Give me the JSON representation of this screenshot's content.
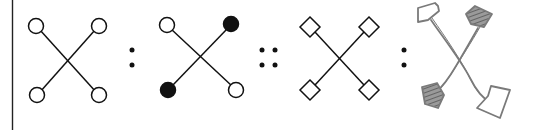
{
  "puzzle": {
    "type": "visual-analogy",
    "relation": "A : B :: C : D",
    "separators": [
      ":",
      "::",
      ":"
    ],
    "colors": {
      "ink": "#111111",
      "sketch": "#7a7a7a",
      "background": "#ffffff"
    },
    "figures": [
      {
        "id": "A",
        "style": "printed",
        "shape": "circle",
        "fills": [
          "open",
          "open",
          "open",
          "open"
        ]
      },
      {
        "id": "B",
        "style": "printed",
        "shape": "circle",
        "fills": [
          "open",
          "filled",
          "filled",
          "open"
        ]
      },
      {
        "id": "C",
        "style": "printed",
        "shape": "diamond",
        "fills": [
          "open",
          "open",
          "open",
          "open"
        ]
      },
      {
        "id": "D",
        "style": "hand-drawn",
        "shape": "mixed",
        "fills": [
          "open-pentagon",
          "hatched-square",
          "hatched-square",
          "open-trapezoid"
        ]
      }
    ]
  }
}
